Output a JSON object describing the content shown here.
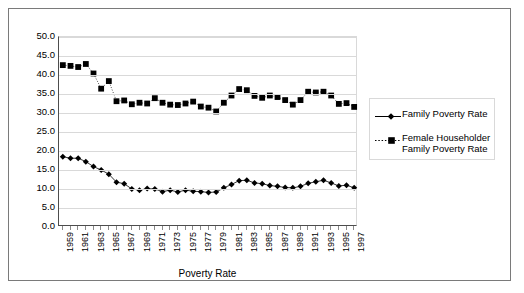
{
  "chart_data": {
    "type": "line",
    "title": "",
    "xlabel": "Poverty Rate",
    "ylabel": "",
    "ylim": [
      0.0,
      50.0
    ],
    "ytick_step": 5.0,
    "yticks": [
      "50.0",
      "45.0",
      "40.0",
      "35.0",
      "30.0",
      "25.0",
      "20.0",
      "15.0",
      "10.0",
      "5.0",
      "0.0"
    ],
    "grid": true,
    "legend_position": "right",
    "x": [
      1959,
      1960,
      1961,
      1962,
      1963,
      1964,
      1965,
      1966,
      1967,
      1968,
      1969,
      1970,
      1971,
      1972,
      1973,
      1974,
      1975,
      1976,
      1977,
      1978,
      1979,
      1980,
      1981,
      1982,
      1983,
      1984,
      1985,
      1986,
      1987,
      1988,
      1989,
      1990,
      1991,
      1992,
      1993,
      1994,
      1995,
      1996,
      1997
    ],
    "xtick_labels": [
      "1959",
      "1961",
      "1963",
      "1965",
      "1967",
      "1969",
      "1971",
      "1973",
      "1975",
      "1977",
      "1979",
      "1981",
      "1983",
      "1985",
      "1987",
      "1989",
      "1991",
      "1993",
      "1995",
      "1997"
    ],
    "series": [
      {
        "name": "Family Poverty Rate",
        "marker": "diamond",
        "line": "solid",
        "color": "#000000",
        "values": [
          18.5,
          18.1,
          18.1,
          17.2,
          15.9,
          15.0,
          13.9,
          11.8,
          11.4,
          10.0,
          9.7,
          10.1,
          10.0,
          9.3,
          9.7,
          9.2,
          9.7,
          9.4,
          9.3,
          9.1,
          9.2,
          10.3,
          11.2,
          12.2,
          12.3,
          11.6,
          11.4,
          10.9,
          10.7,
          10.4,
          10.3,
          10.7,
          11.5,
          11.9,
          12.3,
          11.6,
          10.8,
          11.0,
          10.3
        ]
      },
      {
        "name": "Female Householder\nFamily Poverty Rate",
        "marker": "square",
        "line": "dotted",
        "color": "#000000",
        "values": [
          42.6,
          42.4,
          42.1,
          42.9,
          40.4,
          36.4,
          38.4,
          33.1,
          33.3,
          32.3,
          32.7,
          32.5,
          33.9,
          32.7,
          32.2,
          32.1,
          32.5,
          33.0,
          31.7,
          31.4,
          30.4,
          32.7,
          34.6,
          36.3,
          36.0,
          34.5,
          34.0,
          34.6,
          34.2,
          33.4,
          32.2,
          33.4,
          35.6,
          35.4,
          35.6,
          34.6,
          32.4,
          32.6,
          31.6
        ]
      }
    ]
  },
  "axis": {
    "x_title": "Poverty Rate"
  },
  "legend": {
    "items": [
      {
        "label": "Family Poverty Rate",
        "marker": "diamond-marker-icon",
        "line_style": "solid"
      },
      {
        "label": "Female  Householder\nFamily Poverty Rate",
        "marker": "square-marker-icon",
        "line_style": "dotted"
      }
    ]
  }
}
